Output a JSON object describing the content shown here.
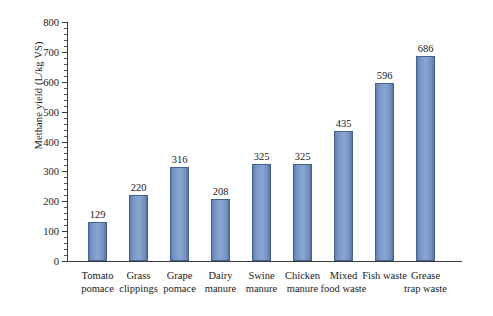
{
  "chart_data": {
    "type": "bar",
    "title": "",
    "xlabel": "",
    "ylabel": "Methane yield (L/kg VS)",
    "ylim": [
      0,
      800
    ],
    "ytick_step": 100,
    "yminor_step": 20,
    "grid": false,
    "legend": null,
    "bar_color": "#7d9acb",
    "bar_edge_color": "#44628f",
    "categories": [
      "Tomato pomace",
      "Grass clippings",
      "Grape pomace",
      "Dairy manure",
      "Swine manure",
      "Chicken manure",
      "Mixed food waste",
      "Fish waste",
      "Grease trap waste"
    ],
    "category_lines": [
      [
        "Tomato",
        "pomace"
      ],
      [
        "Grass",
        "clippings"
      ],
      [
        "Grape",
        "pomace"
      ],
      [
        "Dairy",
        "manure"
      ],
      [
        "Swine",
        "manure"
      ],
      [
        "Chicken",
        "manure"
      ],
      [
        "Mixed",
        "food waste"
      ],
      [
        "Fish waste",
        ""
      ],
      [
        "Grease",
        "trap waste"
      ]
    ],
    "values": [
      129,
      220,
      316,
      208,
      325,
      325,
      435,
      596,
      686
    ],
    "value_labels": [
      "129",
      "220",
      "316",
      "208",
      "325",
      "325",
      "435",
      "596",
      "686"
    ],
    "ytick_labels": [
      "0",
      "100",
      "200",
      "300",
      "400",
      "500",
      "600",
      "700",
      "800"
    ],
    "ytick_values": [
      0,
      100,
      200,
      300,
      400,
      500,
      600,
      700,
      800
    ]
  }
}
